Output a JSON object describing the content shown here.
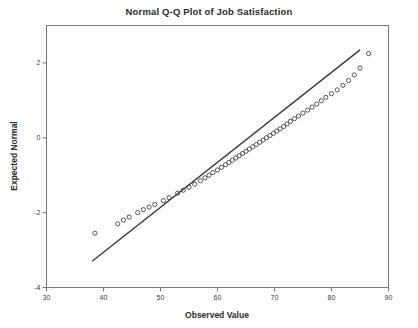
{
  "chart_data": {
    "type": "scatter",
    "title": "Normal Q-Q Plot of Job Satisfaction",
    "xlabel": "Observed Value",
    "ylabel": "Expected Normal",
    "xlim": [
      30,
      90
    ],
    "ylim": [
      -4,
      3
    ],
    "grid": false,
    "legend": null,
    "marker": "open-circle",
    "series": [
      {
        "name": "Q-Q points",
        "x": [
          38.5,
          42.5,
          43.5,
          44.5,
          46.0,
          47.0,
          48.0,
          49.0,
          50.5,
          51.5,
          53.0,
          54.0,
          55.0,
          56.0,
          57.0,
          57.8,
          58.5,
          59.2,
          60.0,
          60.7,
          61.4,
          62.0,
          62.6,
          63.2,
          63.8,
          64.4,
          65.0,
          65.6,
          66.2,
          66.8,
          67.4,
          68.0,
          68.6,
          69.2,
          69.8,
          70.4,
          71.0,
          71.6,
          72.2,
          72.8,
          73.5,
          74.2,
          75.0,
          75.8,
          76.6,
          77.4,
          78.2,
          79.0,
          80.0,
          81.0,
          82.0,
          83.0,
          84.0,
          85.0,
          86.5
        ],
        "y": [
          -2.55,
          -2.3,
          -2.2,
          -2.12,
          -2.0,
          -1.92,
          -1.85,
          -1.78,
          -1.68,
          -1.6,
          -1.48,
          -1.4,
          -1.32,
          -1.24,
          -1.15,
          -1.07,
          -1.0,
          -0.93,
          -0.86,
          -0.79,
          -0.72,
          -0.66,
          -0.6,
          -0.54,
          -0.48,
          -0.42,
          -0.36,
          -0.3,
          -0.24,
          -0.18,
          -0.12,
          -0.06,
          0.0,
          0.06,
          0.12,
          0.18,
          0.24,
          0.3,
          0.37,
          0.44,
          0.51,
          0.58,
          0.66,
          0.74,
          0.82,
          0.9,
          0.99,
          1.08,
          1.18,
          1.28,
          1.4,
          1.53,
          1.68,
          1.86,
          2.25
        ]
      }
    ],
    "reference_line": {
      "name": "normal reference line",
      "x": [
        38.0,
        85.0
      ],
      "y": [
        -3.3,
        2.35
      ]
    },
    "xticks": [
      30,
      40,
      50,
      60,
      70,
      80,
      90
    ],
    "yticks": [
      2,
      0,
      -2,
      -4
    ]
  },
  "axes": {
    "x_title": "Observed Value",
    "y_title": "Expected Normal"
  }
}
